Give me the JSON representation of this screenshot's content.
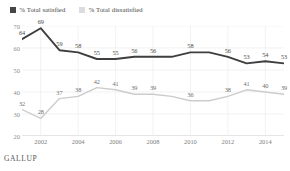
{
  "legend": {
    "position": "top-left",
    "items": [
      {
        "label": "% Total satisfied",
        "color": "#464646",
        "swatch": "dark-swatch"
      },
      {
        "label": "% Total dissatisfied",
        "color": "#dcdcdc",
        "swatch": "light-swatch"
      }
    ]
  },
  "source": "GALLUP",
  "chart_data": {
    "type": "line",
    "title": "",
    "xlabel": "",
    "ylabel": "",
    "ylim": [
      20,
      70
    ],
    "yticks": [
      20,
      30,
      40,
      50,
      60,
      70
    ],
    "grid": true,
    "legend_position": "top-left",
    "x": [
      2001,
      2002,
      2003,
      2004,
      2005,
      2006,
      2007,
      2008,
      2009,
      2010,
      2011,
      2012,
      2013,
      2014,
      2015
    ],
    "xticks": [
      2002,
      2004,
      2006,
      2008,
      2010,
      2012,
      2014
    ],
    "series": [
      {
        "name": "% Total satisfied",
        "color": "#3f3f3f",
        "values": [
          64,
          69,
          59,
          58,
          55,
          55,
          56,
          56,
          56,
          58,
          58,
          56,
          53,
          54,
          53
        ],
        "labels": [
          "64",
          "69",
          "59",
          "58",
          "55",
          "55",
          "56",
          "56",
          "",
          "58",
          "",
          "56",
          "53",
          "54",
          "53"
        ]
      },
      {
        "name": "% Total dissatisfied",
        "color": "#cccccc",
        "values": [
          32,
          28,
          37,
          38,
          42,
          41,
          39,
          39,
          38,
          36,
          36,
          38,
          41,
          40,
          39
        ],
        "labels": [
          "32",
          "28",
          "37",
          "38",
          "42",
          "41",
          "39",
          "39",
          "",
          "36",
          "",
          "38",
          "41",
          "40",
          "39"
        ]
      }
    ]
  }
}
